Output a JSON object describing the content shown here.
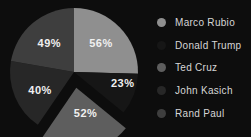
{
  "chart_data": {
    "type": "pie",
    "categories": [
      "Marco Rubio",
      "Donald Trump",
      "Ted Cruz",
      "John Kasich",
      "Rand Paul"
    ],
    "values": [
      56,
      23,
      52,
      40,
      49
    ],
    "slice_labels": [
      "56%",
      "23%",
      "52%",
      "40%",
      "49%"
    ],
    "slice_colors": [
      "#8f8f8f",
      "#161616",
      "#5e5e5e",
      "#272727",
      "#3e3e3e"
    ],
    "start_angle": 0,
    "clockwise": true,
    "exploded_index": 2,
    "legend_position": "right",
    "title": "",
    "background_color": "#0d0d0d",
    "label_text_color": "#f0f0f0",
    "legend_text_color": "#d6d6d6"
  }
}
